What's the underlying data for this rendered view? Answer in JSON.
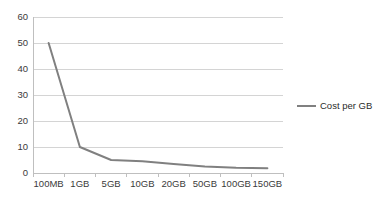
{
  "chart_data": {
    "type": "line",
    "title": "",
    "subtitle": "",
    "xlabel": "",
    "ylabel": "",
    "categories": [
      "100MB",
      "1GB",
      "5GB",
      "10GB",
      "20GB",
      "50GB",
      "100GB",
      "150GB"
    ],
    "series": [
      {
        "name": "Cost per GB",
        "values": [
          50,
          10,
          5,
          4.5,
          3.5,
          2.5,
          2,
          1.8
        ],
        "color": "#808080"
      }
    ],
    "ylim": [
      0,
      60
    ],
    "y_ticks": [
      0,
      10,
      20,
      30,
      40,
      50,
      60
    ],
    "y_tick_labels": [
      "0",
      "10",
      "20",
      "30",
      "40",
      "50",
      "60"
    ],
    "grid": true,
    "grid_axis": "y",
    "grid_color": "#d4d4d4",
    "axis_color": "#bfbfbf",
    "legend": {
      "position": "right",
      "entries": [
        {
          "label": "Cost per GB",
          "color": "#808080",
          "marker": "line"
        }
      ]
    }
  }
}
